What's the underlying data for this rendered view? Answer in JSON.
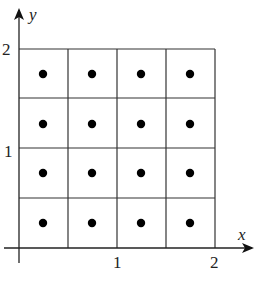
{
  "diagram": {
    "type": "grid-with-midpoints",
    "axes": {
      "x_label": "x",
      "y_label": "y",
      "x_ticks": [
        "1",
        "2"
      ],
      "y_ticks": [
        "1",
        "2"
      ]
    },
    "grid": {
      "rows": 4,
      "cols": 4,
      "x_range": [
        0,
        2
      ],
      "y_range": [
        0,
        2
      ],
      "cell_size": 0.5
    },
    "points": [
      [
        0.25,
        0.25
      ],
      [
        0.75,
        0.25
      ],
      [
        1.25,
        0.25
      ],
      [
        1.75,
        0.25
      ],
      [
        0.25,
        0.75
      ],
      [
        0.75,
        0.75
      ],
      [
        1.25,
        0.75
      ],
      [
        1.75,
        0.75
      ],
      [
        0.25,
        1.25
      ],
      [
        0.75,
        1.25
      ],
      [
        1.25,
        1.25
      ],
      [
        1.75,
        1.25
      ],
      [
        0.25,
        1.75
      ],
      [
        0.75,
        1.75
      ],
      [
        1.25,
        1.75
      ],
      [
        1.75,
        1.75
      ]
    ],
    "colors": {
      "line": "#222222",
      "point": "#000000",
      "background": "#ffffff"
    }
  }
}
